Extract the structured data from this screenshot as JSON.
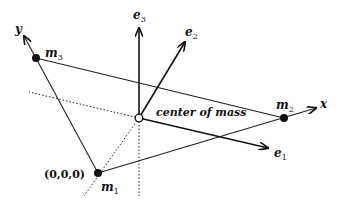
{
  "diagram": {
    "axes": {
      "x_label": "x",
      "y_label": "y"
    },
    "masses": [
      {
        "name": "m",
        "sub": "1",
        "coord_label": "(0,0,0)"
      },
      {
        "name": "m",
        "sub": "2"
      },
      {
        "name": "m",
        "sub": "3"
      }
    ],
    "center_label": "center of mass",
    "basis_vectors": [
      {
        "name": "e",
        "sub": "1"
      },
      {
        "name": "e",
        "sub": "2"
      },
      {
        "name": "e",
        "sub": "3"
      }
    ],
    "colors": {
      "line": "#222222",
      "background": "#ffffff"
    }
  }
}
